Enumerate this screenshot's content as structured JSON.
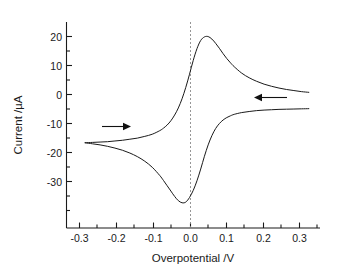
{
  "chart_data": {
    "type": "line",
    "title": "",
    "subtitle": "",
    "xlabel": "Overpotential /V",
    "ylabel": "Current /µA",
    "xlim": [
      -0.35,
      0.33
    ],
    "ylim": [
      -34,
      24
    ],
    "xticks": [
      -0.3,
      -0.2,
      -0.1,
      0.0,
      0.1,
      0.2,
      0.3
    ],
    "xticklabels": [
      "-0.3",
      "-0.2",
      "-0.1",
      "0.0",
      "0.1",
      "0.2",
      "0.3"
    ],
    "yticks": [
      20,
      10,
      0,
      -10,
      -20,
      -30
    ],
    "yticklabels": [
      "20",
      "10",
      "0",
      "-10",
      "-20",
      "-30"
    ],
    "grid": false,
    "legend": null,
    "annotations": [
      {
        "name": "forward-scan-arrow",
        "direction": "right",
        "x": -0.21,
        "y": -7.5,
        "length_v": 0.05
      },
      {
        "name": "reverse-scan-arrow",
        "direction": "left",
        "x": 0.245,
        "y": -0.9,
        "length_v": 0.055
      }
    ],
    "reference_lines": [
      {
        "name": "zero-overpotential-line",
        "axis": "x",
        "value": 0.0,
        "style": "dotted",
        "color": "#8a8a8a"
      }
    ],
    "series": [
      {
        "name": "forward-anodic-sweep",
        "x": [
          -0.3,
          -0.28,
          -0.26,
          -0.24,
          -0.22,
          -0.2,
          -0.18,
          -0.16,
          -0.14,
          -0.12,
          -0.1,
          -0.09,
          -0.08,
          -0.07,
          -0.06,
          -0.05,
          -0.04,
          -0.03,
          -0.02,
          -0.01,
          0.0,
          0.01,
          0.02,
          0.03,
          0.04,
          0.05,
          0.06,
          0.07,
          0.08,
          0.09,
          0.1,
          0.12,
          0.14,
          0.16,
          0.18,
          0.2,
          0.22,
          0.24,
          0.26,
          0.28,
          0.3
        ],
        "y": [
          -10.0,
          -9.9,
          -9.8,
          -9.7,
          -9.5,
          -9.3,
          -9.0,
          -8.7,
          -8.2,
          -7.6,
          -6.6,
          -5.9,
          -5.0,
          -3.8,
          -2.2,
          -0.2,
          2.4,
          5.6,
          9.3,
          13.2,
          16.5,
          18.8,
          19.8,
          19.9,
          19.2,
          18.0,
          16.6,
          15.1,
          13.7,
          12.5,
          11.4,
          9.6,
          8.3,
          7.3,
          6.5,
          5.9,
          5.4,
          5.0,
          4.7,
          4.4,
          4.2
        ]
      },
      {
        "name": "reverse-cathodic-sweep",
        "x": [
          0.3,
          0.28,
          0.26,
          0.24,
          0.22,
          0.2,
          0.18,
          0.16,
          0.14,
          0.12,
          0.1,
          0.09,
          0.08,
          0.07,
          0.06,
          0.05,
          0.04,
          0.03,
          0.02,
          0.01,
          0.0,
          -0.01,
          -0.02,
          -0.03,
          -0.04,
          -0.05,
          -0.06,
          -0.07,
          -0.08,
          -0.09,
          -0.1,
          -0.12,
          -0.14,
          -0.16,
          -0.18,
          -0.2,
          -0.22,
          -0.24,
          -0.26,
          -0.28,
          -0.3
        ],
        "y": [
          -0.4,
          -0.45,
          -0.5,
          -0.55,
          -0.6,
          -0.7,
          -0.8,
          -0.95,
          -1.2,
          -1.5,
          -2.0,
          -2.4,
          -2.9,
          -3.6,
          -4.6,
          -6.0,
          -8.0,
          -10.6,
          -13.8,
          -17.4,
          -20.7,
          -23.4,
          -25.4,
          -26.7,
          -26.9,
          -26.3,
          -25.1,
          -23.6,
          -22.1,
          -20.6,
          -19.2,
          -16.9,
          -15.2,
          -13.9,
          -12.9,
          -12.1,
          -11.5,
          -11.0,
          -10.6,
          -10.3,
          -10.0
        ]
      }
    ],
    "peaks": {
      "anodic_peak": {
        "x": 0.03,
        "y": 19.9,
        "label": ""
      },
      "cathodic_peak": {
        "x": -0.035,
        "y": -26.9,
        "label": ""
      }
    }
  }
}
